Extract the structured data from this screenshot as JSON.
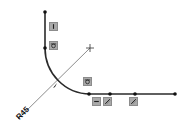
{
  "sketch": {
    "colors": {
      "geometry": "#2a2a2a",
      "construction": "#6e6e6e",
      "vertex": "#111111",
      "icon_bg": "#a9a9a9",
      "icon_border": "#8c8c8c",
      "icon_glyph": "#1e1e1e"
    },
    "dimension": {
      "label": "R45",
      "type": "radius"
    },
    "relations": [
      {
        "name": "vertical",
        "icon": "vertical-relation-icon"
      },
      {
        "name": "tangent",
        "icon": "tangent-relation-icon"
      },
      {
        "name": "tangent",
        "icon": "tangent-relation-icon"
      },
      {
        "name": "horizontal",
        "icon": "horizontal-relation-icon"
      },
      {
        "name": "collinear",
        "icon": "collinear-relation-icon"
      },
      {
        "name": "collinear",
        "icon": "collinear-relation-icon"
      }
    ],
    "entities": [
      {
        "type": "line",
        "orientation": "vertical"
      },
      {
        "type": "arc",
        "tangent": true
      },
      {
        "type": "line",
        "orientation": "horizontal"
      },
      {
        "type": "construction-line",
        "orientation": "diagonal"
      }
    ]
  }
}
